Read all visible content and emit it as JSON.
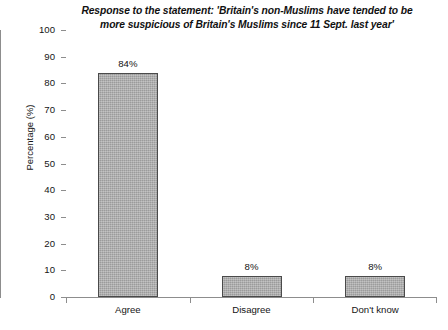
{
  "chart_data": {
    "type": "bar",
    "title": "Response to the statement: 'Britain's non-Muslims have tended to be more suspicious of Britain's Muslims since 11 Sept. last year'",
    "title_lines": [
      "Response to the statement: 'Britain's non-Muslims have tended to be",
      "more suspicious of Britain's Muslims since 11 Sept. last year'"
    ],
    "categories": [
      "Agree",
      "Disagree",
      "Don't know"
    ],
    "values": [
      84,
      8,
      8
    ],
    "value_labels": [
      "84%",
      "8%",
      "8%"
    ],
    "xlabel": "",
    "ylabel": "Percentage (%)",
    "ylim": [
      0,
      100
    ],
    "ytick_values": [
      0,
      10,
      20,
      30,
      40,
      50,
      60,
      70,
      80,
      90,
      100
    ],
    "ytick_labels": [
      "0",
      "10",
      "20",
      "30",
      "40",
      "50",
      "60",
      "70",
      "80",
      "90",
      "100"
    ],
    "grid": false,
    "legend": false,
    "bar_color": "#ababab",
    "bar_edge_color": "#4a4a4a",
    "axis_color": "#8d8d8d",
    "text_color": "#151515"
  }
}
